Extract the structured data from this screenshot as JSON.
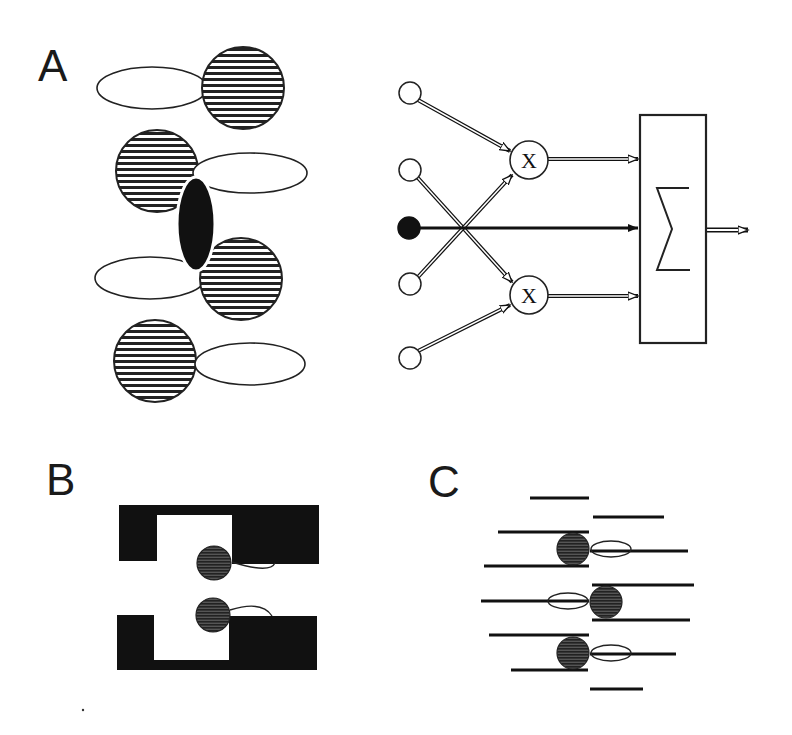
{
  "figure": {
    "panels": [
      {
        "id": "A",
        "label": "A",
        "description": "Receptive field subunits (hatched circles with elongated ellipses) around a central black ellipse; model circuit with input nodes, two multiplication units and a summation unit"
      },
      {
        "id": "B",
        "label": "B",
        "description": "Two opposing black bracket-shaped blocks with gray circular subunits and attached ellipses"
      },
      {
        "id": "C",
        "label": "C",
        "description": "Staggered horizontal line segments with three dark circular subunits and attached ellipses"
      }
    ],
    "circuit": {
      "multiplier_symbol": "X",
      "summation_symbol": "Σ",
      "input_nodes": 5,
      "inhibitory_or_center_node": "filled",
      "multiplier_units": 2
    },
    "colors": {
      "ink": "#111111",
      "hatch": "#222222",
      "subunit_gray": "#444444",
      "background": "#ffffff"
    }
  }
}
